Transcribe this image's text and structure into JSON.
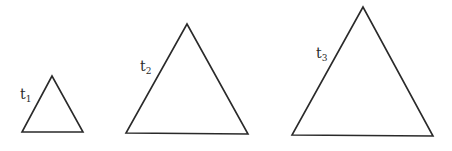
{
  "diagram": {
    "triangles": [
      {
        "id": "t1",
        "label": "t",
        "subscript": "1",
        "points": "52,76 22,132 83,132",
        "label_pos": {
          "x": 20,
          "y": 87
        }
      },
      {
        "id": "t2",
        "label": "t",
        "subscript": "2",
        "points": "187,24 126,133 248,134",
        "label_pos": {
          "x": 140,
          "y": 59
        }
      },
      {
        "id": "t3",
        "label": "t",
        "subscript": "3",
        "points": "363,7 292,135 433,136",
        "label_pos": {
          "x": 316,
          "y": 46
        }
      }
    ],
    "stroke_color": "#2a2a2a",
    "background": "#ffffff"
  }
}
